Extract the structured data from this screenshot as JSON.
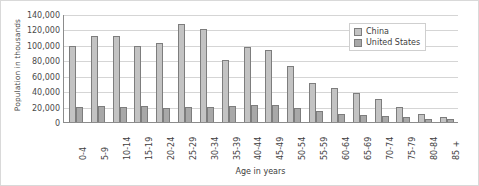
{
  "chart_data": {
    "type": "bar",
    "title": "",
    "xlabel": "Age in years",
    "ylabel": "Population in thousands",
    "ylim": [
      0,
      140000
    ],
    "yticks": [
      0,
      20000,
      40000,
      60000,
      80000,
      100000,
      120000,
      140000
    ],
    "ytick_labels": [
      "0",
      "20,000",
      "40,000",
      "60,000",
      "80,000",
      "100,000",
      "120,000",
      "140,000"
    ],
    "grid": true,
    "legend_position": "top-right",
    "categories": [
      "0-4",
      "5-9",
      "10-14",
      "15-19",
      "20-24",
      "25-29",
      "30-34",
      "35-39",
      "40-44",
      "45-49",
      "50-54",
      "55-59",
      "60-64",
      "65-69",
      "70-74",
      "75-79",
      "80-84",
      "85 +"
    ],
    "series": [
      {
        "name": "China",
        "color": "#c3c3c3",
        "values": [
          98000,
          111000,
          111000,
          98000,
          102000,
          127000,
          121000,
          81000,
          97000,
          94000,
          73000,
          51000,
          44000,
          37000,
          30000,
          20000,
          11000,
          6000
        ]
      },
      {
        "name": "United States",
        "color": "#a8a8a8",
        "values": [
          20000,
          20500,
          20000,
          20500,
          18500,
          19500,
          20000,
          20500,
          22000,
          21500,
          18500,
          14500,
          11000,
          9000,
          7500,
          6000,
          4500,
          4000
        ]
      }
    ]
  },
  "legend": {
    "items": [
      {
        "label": "China"
      },
      {
        "label": "United States"
      }
    ]
  }
}
